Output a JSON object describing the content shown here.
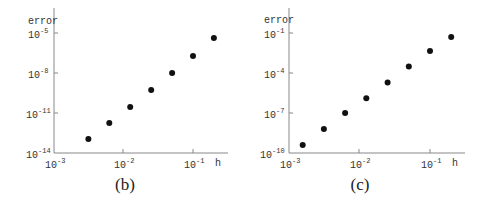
{
  "chart_data": [
    {
      "type": "scatter",
      "panel_label": "(b)",
      "title": "",
      "xlabel": "h",
      "ylabel": "error",
      "xscale": "log",
      "yscale": "log",
      "xlim": [
        0.001,
        0.3
      ],
      "ylim": [
        1e-14,
        0.0001
      ],
      "xticks": [
        0.001,
        0.01,
        0.1
      ],
      "xtick_labels": [
        "10^-3",
        "10^-2",
        "10^-1"
      ],
      "yticks": [
        1e-14,
        1e-11,
        1e-08,
        1e-05
      ],
      "ytick_labels": [
        "10^-14",
        "10^-11",
        "10^-8",
        "10^-5"
      ],
      "grid": false,
      "legend": null,
      "x": [
        0.003125,
        0.00625,
        0.0125,
        0.025,
        0.05,
        0.1,
        0.2
      ],
      "y": [
        1.1e-13,
        1.8e-12,
        2.8e-11,
        5.2e-10,
        1e-08,
        1.9e-07,
        4.2e-06
      ],
      "log10_y": [
        -12.95,
        -11.75,
        -10.55,
        -9.28,
        -8.0,
        -6.73,
        -5.38
      ]
    },
    {
      "type": "scatter",
      "panel_label": "(c)",
      "title": "",
      "xlabel": "h",
      "ylabel": "error",
      "xscale": "log",
      "yscale": "log",
      "xlim": [
        0.001,
        0.3
      ],
      "ylim": [
        1e-10,
        1
      ],
      "xticks": [
        0.001,
        0.01,
        0.1
      ],
      "xtick_labels": [
        "10^-3",
        "10^-2",
        "10^-1"
      ],
      "yticks": [
        1e-10,
        1e-07,
        0.0001,
        0.1
      ],
      "ytick_labels": [
        "10^-10",
        "10^-7",
        "10^-4",
        "10^-1"
      ],
      "grid": false,
      "legend": null,
      "x": [
        0.0015625,
        0.003125,
        0.00625,
        0.0125,
        0.025,
        0.05,
        0.1,
        0.2
      ],
      "y": [
        4e-10,
        6.3e-09,
        1e-07,
        1.3e-06,
        2e-05,
        0.00032,
        0.0045,
        0.05
      ],
      "log10_y": [
        -9.4,
        -8.2,
        -7.0,
        -5.9,
        -4.7,
        -3.5,
        -2.35,
        -1.3
      ]
    }
  ],
  "panels": [
    {
      "ylabel": "error",
      "xlabel": "h",
      "caption": "(b)",
      "yticks": [
        {
          "base": "10",
          "exp": "-5"
        },
        {
          "base": "10",
          "exp": "-8"
        },
        {
          "base": "10",
          "exp": "-11"
        },
        {
          "base": "10",
          "exp": "-14"
        }
      ],
      "xticks": [
        {
          "base": "10",
          "exp": "-3"
        },
        {
          "base": "10",
          "exp": "-2"
        },
        {
          "base": "10",
          "exp": "-1"
        }
      ]
    },
    {
      "ylabel": "error",
      "xlabel": "h",
      "caption": "(c)",
      "yticks": [
        {
          "base": "10",
          "exp": "-1"
        },
        {
          "base": "10",
          "exp": "-4"
        },
        {
          "base": "10",
          "exp": "-7"
        },
        {
          "base": "10",
          "exp": "-10"
        }
      ],
      "xticks": [
        {
          "base": "10",
          "exp": "-3"
        },
        {
          "base": "10",
          "exp": "-2"
        },
        {
          "base": "10",
          "exp": "-1"
        }
      ]
    }
  ],
  "colors": {
    "marker": "#111111",
    "axis": "#888888",
    "text": "#333333"
  }
}
